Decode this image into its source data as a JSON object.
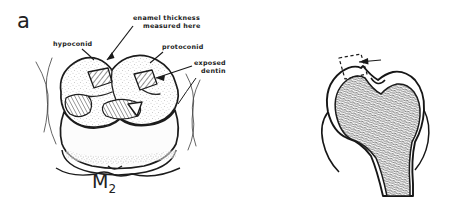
{
  "figure": {
    "background_color": "#ffffff",
    "ink_color": "#1a1a1a"
  },
  "panels": [
    {
      "letter": "a",
      "name": "occlusal-view",
      "tooth_id": "M",
      "tooth_id_subscript": "2",
      "labels": [
        {
          "name": "enamel-thickness-measured-here",
          "line1": "enamel thickness",
          "line2": "measured here"
        },
        {
          "name": "hypoconid",
          "line1": "hypoconid",
          "line2": ""
        },
        {
          "name": "protoconid",
          "line1": "protoconid",
          "line2": ""
        },
        {
          "name": "exposed-dentin",
          "line1": "exposed",
          "line2": "dentin"
        }
      ]
    },
    {
      "letter": "b",
      "name": "cross-section-view",
      "labels": [
        {
          "name": "enamel-thickness",
          "line1": "enamel thickness",
          "line2": ""
        }
      ]
    }
  ]
}
